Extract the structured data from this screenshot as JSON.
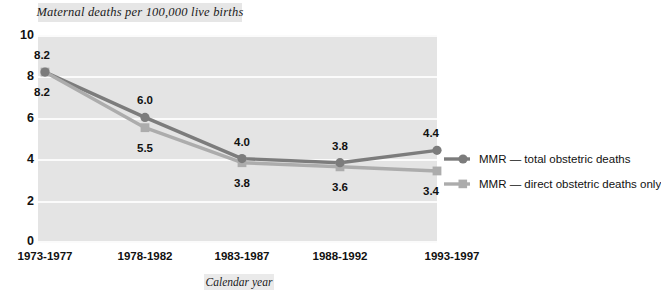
{
  "chart_data": {
    "type": "line",
    "title": "Maternal deaths per 100,000 live births",
    "xlabel": "Calendar year",
    "ylabel": "",
    "categories": [
      "1973-1977",
      "1978-1982",
      "1983-1987",
      "1988-1992",
      "1993-1997"
    ],
    "series": [
      {
        "name": "MMR — total obstetric deaths",
        "values": [
          8.2,
          6.0,
          4.0,
          3.8,
          4.4
        ],
        "labels": [
          "8.2",
          "6.0",
          "4.0",
          "3.8",
          "4.4"
        ],
        "color": "#7c7c7c",
        "marker": "circle"
      },
      {
        "name": "MMR — direct obstetric deaths only",
        "values": [
          8.2,
          5.5,
          3.8,
          3.6,
          3.4
        ],
        "labels": [
          "8.2",
          "5.5",
          "3.8",
          "3.6",
          "3.4"
        ],
        "color": "#acacac",
        "marker": "square"
      }
    ],
    "ylim": [
      0,
      10
    ],
    "yticks": [
      "0",
      "2",
      "4",
      "6",
      "8",
      "10"
    ],
    "grid": true,
    "legend_position": "right"
  },
  "legend": {
    "items": [
      {
        "label": "MMR — total obstetric deaths"
      },
      {
        "label": "MMR — direct obstetric deaths only"
      }
    ]
  }
}
